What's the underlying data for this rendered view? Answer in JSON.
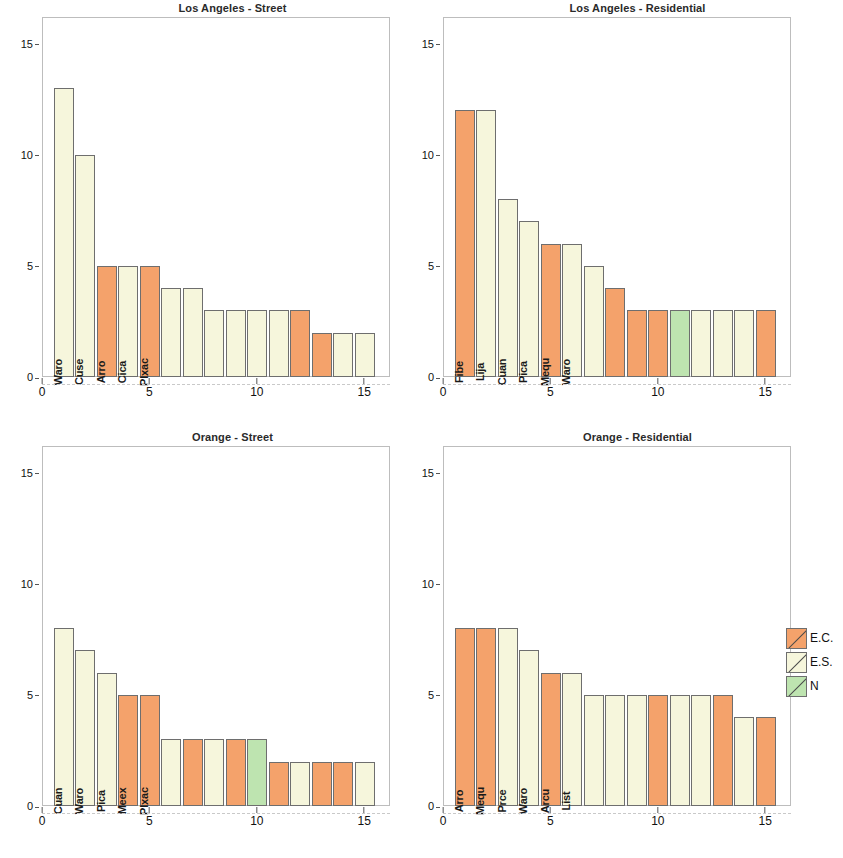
{
  "figure": {
    "ylabel": "Species Abundance",
    "colors": {
      "EC": "#F4A26B",
      "ES": "#F6F6DC",
      "N": "#BEE4B0",
      "bar_outline": "#6e6e6e",
      "axis": "#555555",
      "box": "#bdbdbd"
    }
  },
  "legend": {
    "items": [
      {
        "label": "E.C.",
        "color_key": "EC",
        "icon": "swatch-diagonal-icon"
      },
      {
        "label": "E.S.",
        "color_key": "ES",
        "icon": "swatch-diagonal-icon"
      },
      {
        "label": "N",
        "color_key": "N",
        "icon": "swatch-diagonal-icon"
      }
    ]
  },
  "axes": {
    "y": {
      "ticks": [
        0,
        5,
        10,
        15
      ],
      "min": 0,
      "max": 16.2,
      "label": "Species Abundance"
    },
    "x": {
      "ticks": [
        0,
        5,
        10,
        15
      ],
      "min": 0,
      "max": 16.2,
      "label": ""
    }
  },
  "chart_data": [
    {
      "type": "bar",
      "panel": "top-left",
      "title": "Los Angeles - Street",
      "xlabel": "",
      "ylabel": "Species Abundance",
      "ylim": [
        0,
        16.2
      ],
      "xlim": [
        0,
        16.2
      ],
      "grid": false,
      "categories": [
        "Waro",
        "Cuse",
        "Arro",
        "Cica",
        "Plxac",
        "",
        "",
        "",
        "",
        "",
        "",
        "",
        "",
        "",
        ""
      ],
      "values": [
        13,
        10,
        5,
        5,
        5,
        4,
        4,
        3,
        3,
        3,
        3,
        3,
        2,
        2,
        2
      ],
      "groups": [
        "ES",
        "ES",
        "EC",
        "ES",
        "EC",
        "ES",
        "ES",
        "ES",
        "ES",
        "ES",
        "ES",
        "EC",
        "EC",
        "ES",
        "ES"
      ]
    },
    {
      "type": "bar",
      "panel": "top-right",
      "title": "Los Angeles - Residential",
      "xlabel": "",
      "ylabel": "",
      "ylim": [
        0,
        16.2
      ],
      "xlim": [
        0,
        16.2
      ],
      "grid": false,
      "categories": [
        "Fibe",
        "Lija",
        "Cuan",
        "Pica",
        "Mequ",
        "Waro",
        "",
        "",
        "",
        "",
        "",
        "",
        "",
        "",
        ""
      ],
      "values": [
        12,
        12,
        8,
        7,
        6,
        6,
        5,
        4,
        3,
        3,
        3,
        3,
        3,
        3,
        3
      ],
      "groups": [
        "EC",
        "ES",
        "ES",
        "ES",
        "EC",
        "ES",
        "ES",
        "EC",
        "EC",
        "EC",
        "N",
        "ES",
        "ES",
        "ES",
        "EC"
      ]
    },
    {
      "type": "bar",
      "panel": "bottom-left",
      "title": "Orange - Street",
      "xlabel": "",
      "ylabel": "Species Abundance",
      "ylim": [
        0,
        16.2
      ],
      "xlim": [
        0,
        16.2
      ],
      "grid": false,
      "categories": [
        "Cuan",
        "Waro",
        "Pica",
        "Meex",
        "Plxac",
        "",
        "",
        "",
        "",
        "",
        "",
        "",
        "",
        "",
        ""
      ],
      "values": [
        8,
        7,
        6,
        5,
        5,
        3,
        3,
        3,
        3,
        3,
        2,
        2,
        2,
        2,
        2
      ],
      "groups": [
        "ES",
        "ES",
        "ES",
        "EC",
        "EC",
        "ES",
        "EC",
        "ES",
        "EC",
        "N",
        "EC",
        "ES",
        "EC",
        "EC",
        "ES"
      ]
    },
    {
      "type": "bar",
      "panel": "bottom-right",
      "title": "Orange - Residential",
      "xlabel": "",
      "ylabel": "",
      "ylim": [
        0,
        16.2
      ],
      "xlim": [
        0,
        16.2
      ],
      "grid": false,
      "categories": [
        "Arro",
        "Mequ",
        "Prce",
        "Waro",
        "Arcu",
        "List",
        "",
        "",
        "",
        "",
        "",
        "",
        "",
        "",
        ""
      ],
      "values": [
        8,
        8,
        8,
        7,
        6,
        6,
        5,
        5,
        5,
        5,
        5,
        5,
        5,
        4,
        4
      ],
      "groups": [
        "EC",
        "EC",
        "ES",
        "ES",
        "EC",
        "ES",
        "ES",
        "ES",
        "ES",
        "EC",
        "ES",
        "ES",
        "EC",
        "ES",
        "EC"
      ]
    }
  ]
}
